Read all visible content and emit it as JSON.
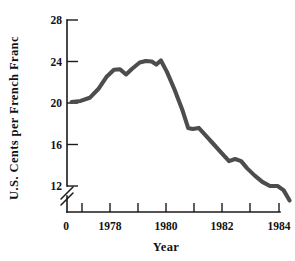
{
  "chart_data": {
    "type": "line",
    "title": "",
    "xlabel": "Year",
    "ylabel": "U.S. Cents per French Franc",
    "xlim": [
      1977.0,
      1984.5
    ],
    "ylim": [
      10.0,
      28.0
    ],
    "y_axis_break": true,
    "y_break_label": "0",
    "grid": false,
    "legend": null,
    "yticks": [
      12,
      16,
      20,
      24,
      28
    ],
    "ytick_labels": [
      "12",
      "16",
      "20",
      "24",
      "28"
    ],
    "xticks": [
      1977.5,
      1978,
      1978.5,
      1979,
      1979.5,
      1980,
      1980.5,
      1981,
      1981.5,
      1982,
      1982.5,
      1983,
      1983.5,
      1984,
      1984.5
    ],
    "xtick_labels_major": [
      "1978",
      "1980",
      "1982",
      "1984"
    ],
    "xticks_major": [
      1978,
      1980,
      1982,
      1984
    ],
    "series": [
      {
        "name": "U.S. Cents per French Franc",
        "color": "#4d4d4d",
        "x": [
          1977.15,
          1977.45,
          1977.75,
          1978.05,
          1978.3,
          1978.55,
          1978.75,
          1978.95,
          1979.15,
          1979.4,
          1979.6,
          1979.8,
          1979.95,
          1980.1,
          1980.3,
          1980.55,
          1980.8,
          1981.0,
          1981.15,
          1981.35,
          1981.6,
          1981.85,
          1982.1,
          1982.35,
          1982.55,
          1982.75,
          1982.95,
          1983.2,
          1983.45,
          1983.7,
          1983.95,
          1984.15,
          1984.35
        ],
        "y": [
          20.1,
          20.2,
          20.5,
          21.4,
          22.5,
          23.2,
          23.25,
          22.75,
          23.3,
          23.9,
          24.05,
          24.0,
          23.7,
          24.1,
          23.0,
          21.3,
          19.4,
          17.6,
          17.5,
          17.6,
          16.8,
          16.0,
          15.2,
          14.4,
          14.6,
          14.4,
          13.7,
          13.0,
          12.4,
          12.0,
          12.0,
          11.6,
          10.6
        ]
      }
    ]
  },
  "labels": {
    "y_axis_title": "U.S. Cents per French Franc",
    "x_axis_title": "Year",
    "origin_label": "0"
  }
}
